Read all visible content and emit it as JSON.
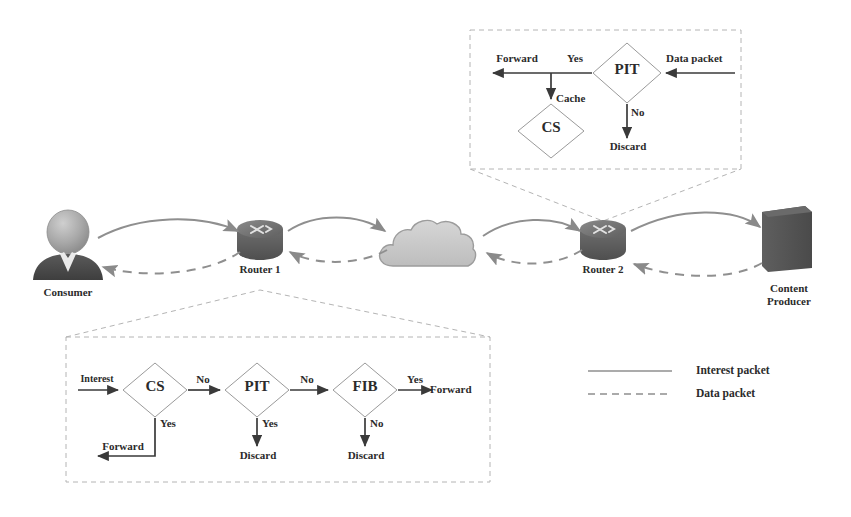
{
  "figure": {
    "type": "diagram",
    "palette": {
      "stroke": "#6e6e6e",
      "text": "#2b2b2b",
      "arrow": "#8a8a8a",
      "diamond_stroke": "#8c8c8c",
      "flow_arrow": "#3a3a3a",
      "dashed_callout": "#b0b0b0",
      "router_body": "#6b6b6b",
      "cloud_fill": "#c9c9c9",
      "producer_fill": "#5a5a5a",
      "consumer_head": "#9e9e9e",
      "consumer_body": "#4a4a4a",
      "background": "#ffffff"
    }
  },
  "topology": {
    "nodes": [
      {
        "id": "consumer",
        "label": "Consumer",
        "icon": "person-icon",
        "x": 68,
        "y": 243
      },
      {
        "id": "router1",
        "label": "Router 1",
        "icon": "router-icon",
        "x": 260,
        "y": 238
      },
      {
        "id": "network",
        "label": "",
        "icon": "cloud-icon",
        "x": 430,
        "y": 243
      },
      {
        "id": "router2",
        "label": "Router 2",
        "icon": "router-icon",
        "x": 603,
        "y": 238
      },
      {
        "id": "producer",
        "label": "Content\nProducer",
        "icon": "server-icon",
        "x": 788,
        "y": 243
      }
    ],
    "links": [
      {
        "from": "consumer",
        "to": "router1",
        "kind": "interest"
      },
      {
        "from": "router1",
        "to": "network",
        "kind": "interest"
      },
      {
        "from": "network",
        "to": "router2",
        "kind": "interest"
      },
      {
        "from": "router2",
        "to": "producer",
        "kind": "interest"
      },
      {
        "from": "router1",
        "to": "consumer",
        "kind": "data"
      },
      {
        "from": "network",
        "to": "router1",
        "kind": "data"
      },
      {
        "from": "router2",
        "to": "network",
        "kind": "data"
      },
      {
        "from": "producer",
        "to": "router2",
        "kind": "data"
      }
    ]
  },
  "interest_detail": {
    "attached_to": "router1",
    "box": {
      "x": 66,
      "y": 337,
      "w": 424,
      "h": 145
    },
    "entry_label": "Interest",
    "decisions": [
      {
        "id": "cs",
        "label": "CS",
        "yes": "Yes",
        "no": "No"
      },
      {
        "id": "pit",
        "label": "PIT",
        "yes": "Yes",
        "no": "No"
      },
      {
        "id": "fib",
        "label": "FIB",
        "yes": "Yes",
        "no": "No"
      }
    ],
    "edge_labels": {
      "cs_no": "No",
      "cs_yes": "Yes",
      "pit_no": "No",
      "pit_yes": "Yes",
      "fib_no": "No",
      "fib_yes": "Yes"
    },
    "terminals": {
      "cs_yes_action": "Forward",
      "pit_yes_action": "Discard",
      "fib_no_action": "Discard",
      "fib_yes_action": "Forward"
    }
  },
  "data_detail": {
    "attached_to": "router2",
    "box": {
      "x": 470,
      "y": 30,
      "w": 271,
      "h": 139
    },
    "entry_label": "Data packet",
    "decisions": [
      {
        "id": "pit",
        "label": "PIT",
        "yes": "Yes",
        "no": "No"
      },
      {
        "id": "cs",
        "label": "CS"
      }
    ],
    "edge_labels": {
      "pit_yes": "Yes",
      "pit_no": "No",
      "cache": "Cache"
    },
    "terminals": {
      "pit_yes_action": "Forward",
      "pit_no_action": "Discard"
    }
  },
  "legend": {
    "items": [
      {
        "label": "Interest packet",
        "style": "solid"
      },
      {
        "label": "Data packet",
        "style": "dashed"
      }
    ]
  }
}
